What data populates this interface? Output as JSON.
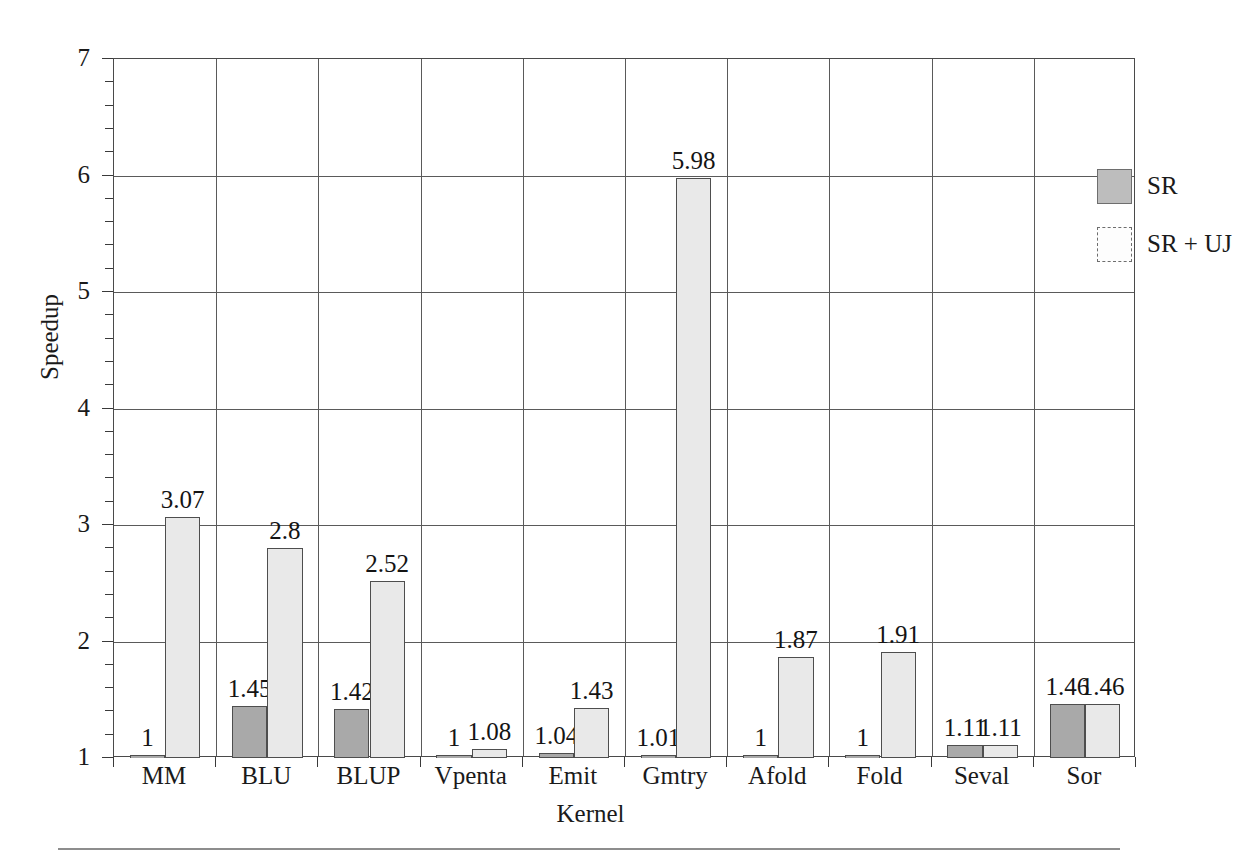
{
  "chart_data": {
    "type": "bar",
    "title": "",
    "xlabel": "Kernel",
    "ylabel": "Speedup",
    "ylim": [
      1,
      7
    ],
    "ytick_values": [
      1,
      2,
      3,
      4,
      5,
      6,
      7
    ],
    "ytick_labels": [
      "1",
      "2",
      "3",
      "4",
      "5",
      "6",
      "7"
    ],
    "y_minor_step": 0.2,
    "grid": "both",
    "legend_position": "top-right",
    "categories": [
      "MM",
      "BLU",
      "BLUP",
      "Vpenta",
      "Emit",
      "Gmtry",
      "Afold",
      "Fold",
      "Seval",
      "Sor"
    ],
    "series": [
      {
        "name": "SR",
        "color": "#a9a9a9",
        "values": [
          1,
          1.45,
          1.42,
          1,
          1.04,
          1.01,
          1,
          1,
          1.11,
          1.46
        ],
        "labels": [
          "1",
          "1.45",
          "1.42",
          "1",
          "1.04",
          "1.01",
          "1",
          "1",
          "1.11",
          "1.46"
        ]
      },
      {
        "name": "SR + UJ",
        "color": "#e9e9e9",
        "values": [
          3.07,
          2.8,
          2.52,
          1.08,
          1.43,
          5.98,
          1.87,
          1.91,
          1.11,
          1.46
        ],
        "labels": [
          "3.07",
          "2.8",
          "2.52",
          "1.08",
          "1.43",
          "5.98",
          "1.87",
          "1.91",
          "1.11",
          "1.46"
        ]
      }
    ]
  },
  "axis": {
    "y_label": "Speedup",
    "x_label": "Kernel"
  },
  "legend": {
    "entries": [
      {
        "label": "SR"
      },
      {
        "label": "SR + UJ"
      }
    ]
  },
  "ticks": {
    "y": [
      "7",
      "6",
      "5",
      "4",
      "3",
      "2",
      "1"
    ],
    "x": [
      "MM",
      "BLU",
      "BLUP",
      "Vpenta",
      "Emit",
      "Gmtry",
      "Afold",
      "Fold",
      "Seval",
      "Sor"
    ]
  }
}
